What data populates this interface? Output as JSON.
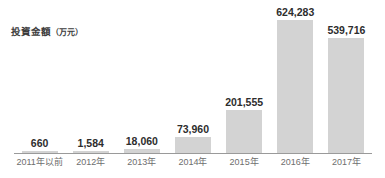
{
  "chart_data": {
    "type": "bar",
    "title": "投資金額（万元）",
    "title_main": "投資金額",
    "title_unit": "（万元）",
    "xlabel": "",
    "ylabel": "投資金額（万元）",
    "grid": false,
    "legend": "none",
    "ylim": [
      0,
      660000
    ],
    "categories": [
      "2011年以前",
      "2012年",
      "2013年",
      "2014年",
      "2015年",
      "2016年",
      "2017年"
    ],
    "values": [
      660,
      1584,
      18060,
      73960,
      201555,
      624283,
      539716
    ],
    "value_labels": [
      "660",
      "1,584",
      "18,060",
      "73,960",
      "201,555",
      "624,283",
      "539,716"
    ],
    "bar_color": "#d3d3d3",
    "axis_color": "#9a9a9a",
    "label_color": "#2d2d2d",
    "tick_color": "#6e6e6e"
  }
}
